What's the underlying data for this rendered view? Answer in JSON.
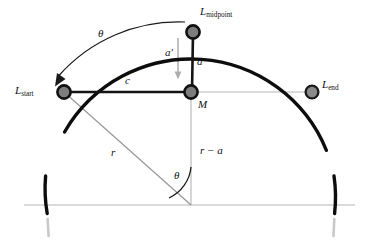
{
  "figure": {
    "type": "geometry-diagram",
    "background_color": "#ffffff",
    "arc_color": "#0d0d0d",
    "guide_color": "#b3b3b3",
    "radius_line_color": "#9a9a9a",
    "node_ring_color": "#111111",
    "node_fill_color": "#808080"
  },
  "geometry": {
    "center": {
      "x": 191,
      "y": 205
    },
    "radius": 146,
    "arc_start_deg": 150,
    "arc_end_deg": 22,
    "points": {
      "L_start": {
        "x": 64,
        "y": 92
      },
      "M": {
        "x": 191,
        "y": 92
      },
      "L_end": {
        "x": 312,
        "y": 92
      },
      "L_midpoint": {
        "x": 193,
        "y": 32
      }
    },
    "baseline_y": 205,
    "baseline_x1": 24,
    "baseline_x2": 355
  },
  "labels": {
    "l_start": {
      "base": "L",
      "sub": "start"
    },
    "l_end": {
      "base": "L",
      "sub": "end"
    },
    "l_midpoint": {
      "base": "L",
      "sub": "midpoint"
    },
    "midpoint_label_m": "M",
    "chord": "c",
    "sagitta": "a",
    "sagitta_prime": "a'",
    "radius": "r",
    "radius_minus_a": "r − a",
    "theta_arc": "θ",
    "theta_center": "θ"
  }
}
